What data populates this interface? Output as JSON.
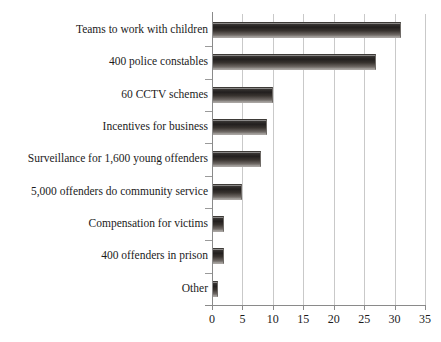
{
  "chart_data": {
    "type": "bar",
    "orientation": "horizontal",
    "title": "",
    "subtitle": "",
    "xlabel": "",
    "ylabel": "",
    "xlim": [
      0,
      35
    ],
    "xticks": [
      0,
      5,
      10,
      15,
      20,
      25,
      30,
      35
    ],
    "xtick_labels": [
      "0",
      "5",
      "10",
      "15",
      "20",
      "25",
      "30",
      "35"
    ],
    "grid": "vertical",
    "legend": "none",
    "categories": [
      "Teams to work with children",
      "400 police constables",
      "60 CCTV schemes",
      "Incentives for business",
      "Surveillance for 1,600 young offenders",
      "5,000 offenders do community service",
      "Compensation for victims",
      "400 offenders in prison",
      "Other"
    ],
    "values": [
      31,
      27,
      10,
      9,
      8,
      5,
      2,
      2,
      1
    ],
    "series": [
      {
        "name": "",
        "values": [
          31,
          27,
          10,
          9,
          8,
          5,
          2,
          2,
          1
        ]
      }
    ],
    "bar_color": "#262322",
    "bar_color_light": "#b0acaa",
    "gridline_color": "#c9c9c9",
    "axis_color": "#8a8a8a",
    "text_color": "#1b1b1b",
    "background_color": "#ffffff"
  }
}
